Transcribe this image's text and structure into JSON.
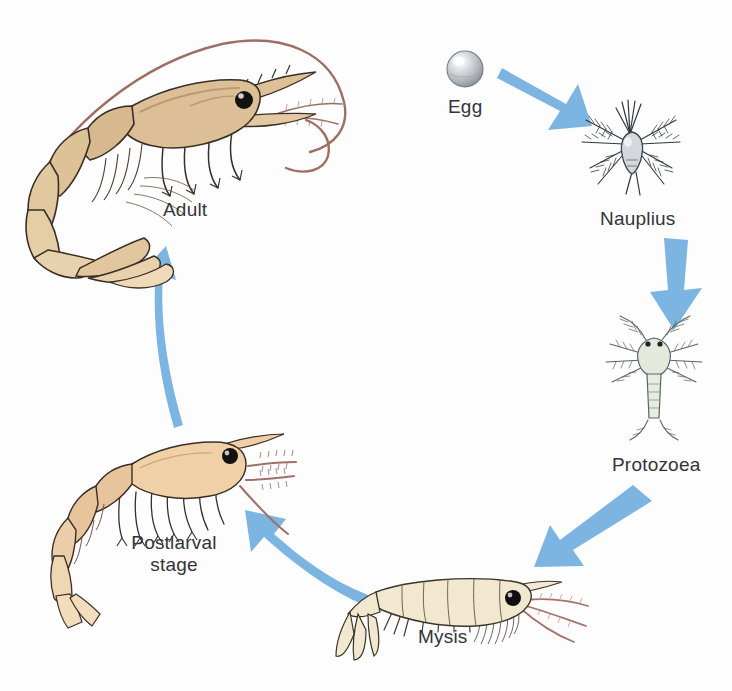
{
  "diagram": {
    "type": "cycle",
    "background_color": "#fdfdfd",
    "arrow_color": "#7cb4e2",
    "label_color": "#333437"
  },
  "stages": [
    {
      "id": "egg",
      "label": "Egg",
      "order": 1,
      "label_x": 448,
      "label_y": 96,
      "colors": {
        "body": "#b9bcbf",
        "highlight": "#ffffff",
        "outline": "#6f7478"
      }
    },
    {
      "id": "nauplius",
      "label": "Nauplius",
      "order": 2,
      "label_x": 600,
      "label_y": 208,
      "colors": {
        "body": "#cfd5da",
        "appendages": "#3f4a52",
        "outline": "#2e363c"
      }
    },
    {
      "id": "protozoea",
      "label": "Protozoea",
      "order": 3,
      "label_x": 612,
      "label_y": 454,
      "colors": {
        "body": "#dfe4d9",
        "appendages": "#7d8a8c",
        "outline": "#55605f"
      }
    },
    {
      "id": "mysis",
      "label": "Mysis",
      "order": 4,
      "label_x": 418,
      "label_y": 626,
      "colors": {
        "body": "#efe6cc",
        "antenna": "#a5736b",
        "eye": "#111111",
        "outline": "#37322a"
      }
    },
    {
      "id": "postlarval",
      "label": "Postlarval\nstage",
      "order": 5,
      "label_x": 119,
      "label_y": 532,
      "colors": {
        "body": "#e7c49c",
        "antenna": "#9c7068",
        "eye": "#111111",
        "outline": "#3a2f26"
      }
    },
    {
      "id": "adult",
      "label": "Adult",
      "order": 6,
      "label_x": 163,
      "label_y": 199,
      "colors": {
        "body": "#d9bb93",
        "shade": "#bb9a72",
        "antenna": "#9d6f62",
        "eye": "#111111",
        "outline": "#3a2f26"
      }
    }
  ],
  "arrows": [
    {
      "id": "egg-to-nauplius",
      "from": "egg",
      "to": "nauplius"
    },
    {
      "id": "nauplius-to-protozoea",
      "from": "nauplius",
      "to": "protozoea"
    },
    {
      "id": "protozoea-to-mysis",
      "from": "protozoea",
      "to": "mysis"
    },
    {
      "id": "mysis-to-postlarval",
      "from": "mysis",
      "to": "postlarval"
    },
    {
      "id": "postlarval-to-adult",
      "from": "postlarval",
      "to": "adult"
    }
  ]
}
